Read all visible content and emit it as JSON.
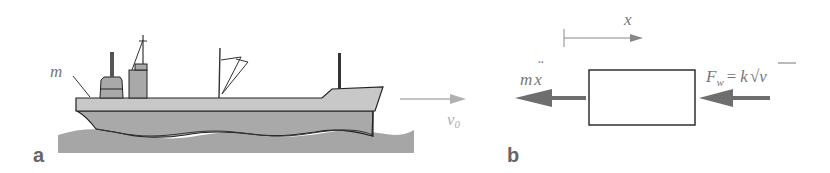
{
  "figure": {
    "panel_a": {
      "label": "a",
      "mass_label": "m",
      "velocity_label": "v",
      "velocity_subscript": "0",
      "colors": {
        "water": "#a6a6a6",
        "hull": "#a9a9a9",
        "deck": "#c8c8c8",
        "outline": "#222222",
        "velocity_arrow": "#b0b0b0"
      }
    },
    "panel_b": {
      "label": "b",
      "axis_label": "x",
      "inertia_label_m": "m",
      "inertia_label_x": "x",
      "inertia_dots": "¨",
      "force_label_F": "F",
      "force_subscript": "w",
      "force_equals": "=",
      "force_k": "k",
      "force_sqrt": "√",
      "force_v": "v",
      "colors": {
        "arrow": "#6e6e6e",
        "box_outline": "#222222",
        "axis": "#888888"
      }
    }
  }
}
